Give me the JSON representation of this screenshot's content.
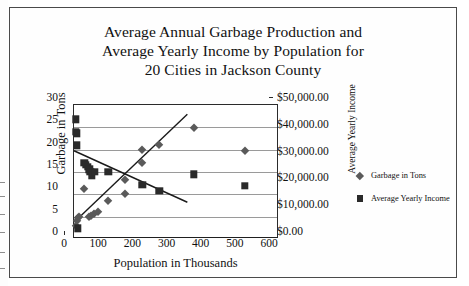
{
  "chart_data": {
    "type": "scatter",
    "title": "Average Annual Garbage Production and Average Yearly Income by Population for 20 Cities in Jackson County",
    "title_lines": [
      "Average Annual Garbage Production and",
      "Average Yearly Income by Population for",
      "20 Cities in Jackson County"
    ],
    "xlabel": "Population in Thousands",
    "ylabel": "Garbage in Tons",
    "y2label": "Average Yearly Income",
    "xlim": [
      0,
      600
    ],
    "ylim": [
      0,
      30
    ],
    "y2lim": [
      0,
      50000
    ],
    "grid": "horizontal",
    "legend_position": "right",
    "xticks": [
      "0",
      "100",
      "200",
      "300",
      "400",
      "500",
      "600"
    ],
    "xtick_values": [
      0,
      100,
      200,
      300,
      400,
      500,
      600
    ],
    "yticks": [
      "0",
      "5",
      "10",
      "15",
      "20",
      "25",
      "30"
    ],
    "ytick_values": [
      0,
      5,
      10,
      15,
      20,
      25,
      30
    ],
    "y2ticks": [
      "$0.00",
      "$10,000.00",
      "$20,000.00",
      "$30,000.00",
      "$40,000.00",
      "$50,000.00"
    ],
    "y2tick_values": [
      0,
      10000,
      20000,
      30000,
      40000,
      50000
    ],
    "series": [
      {
        "name": "Garbage in Tons",
        "marker": "diamond",
        "color": "#5a5a5a",
        "axis": "left",
        "points": [
          {
            "x": 5,
            "y": 3.0
          },
          {
            "x": 8,
            "y": 4.0
          },
          {
            "x": 12,
            "y": 4.6
          },
          {
            "x": 15,
            "y": 5.0
          },
          {
            "x": 30,
            "y": 11.2
          },
          {
            "x": 45,
            "y": 5.0
          },
          {
            "x": 50,
            "y": 5.2
          },
          {
            "x": 58,
            "y": 5.6
          },
          {
            "x": 70,
            "y": 6.0
          },
          {
            "x": 100,
            "y": 8.4
          },
          {
            "x": 150,
            "y": 10.0
          },
          {
            "x": 150,
            "y": 13.3
          },
          {
            "x": 200,
            "y": 17.1
          },
          {
            "x": 200,
            "y": 20.0
          },
          {
            "x": 250,
            "y": 21.0
          },
          {
            "x": 350,
            "y": 24.8
          },
          {
            "x": 500,
            "y": 19.8
          }
        ]
      },
      {
        "name": "Average Yearly Income",
        "marker": "square",
        "color": "#2a2a2a",
        "axis": "right",
        "points": [
          {
            "x": 5,
            "y": 26.8,
            "value": 44700
          },
          {
            "x": 6,
            "y": 24.0,
            "value": 40000
          },
          {
            "x": 8,
            "y": 23.7,
            "value": 39500
          },
          {
            "x": 8,
            "y": 21.0,
            "value": 35000
          },
          {
            "x": 12,
            "y": 2.4,
            "value": 4000
          },
          {
            "x": 30,
            "y": 17.0,
            "value": 28300
          },
          {
            "x": 35,
            "y": 16.6,
            "value": 27700
          },
          {
            "x": 40,
            "y": 16.2,
            "value": 27000
          },
          {
            "x": 45,
            "y": 15.6,
            "value": 26000
          },
          {
            "x": 48,
            "y": 15.0,
            "value": 25000
          },
          {
            "x": 52,
            "y": 14.3,
            "value": 23800
          },
          {
            "x": 60,
            "y": 15.0,
            "value": 25000
          },
          {
            "x": 100,
            "y": 15.0,
            "value": 25000
          },
          {
            "x": 200,
            "y": 12.2,
            "value": 20300
          },
          {
            "x": 250,
            "y": 10.8,
            "value": 18000
          },
          {
            "x": 350,
            "y": 14.5,
            "value": 24200
          },
          {
            "x": 500,
            "y": 11.9,
            "value": 19800
          }
        ]
      }
    ],
    "trendlines": [
      {
        "name": "garbage-trendline",
        "series": "Garbage in Tons",
        "x0": 8,
        "y0": 3.9,
        "x1": 335,
        "y1": 27.9
      },
      {
        "name": "income-trendline",
        "series": "Average Yearly Income",
        "x0": 0,
        "y0": 19.6,
        "x1": 335,
        "y1": 7.9
      }
    ],
    "legend": [
      {
        "label": "Garbage in Tons",
        "marker": "diamond"
      },
      {
        "label": "Average Yearly Income",
        "marker": "square"
      }
    ]
  }
}
